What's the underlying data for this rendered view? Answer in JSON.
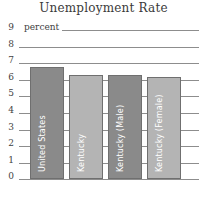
{
  "chart_data": {
    "type": "bar",
    "title": "Unemployment Rate",
    "xlabel": "",
    "ylabel": "percent",
    "unit_label": "percent",
    "ylim": [
      0,
      9
    ],
    "grid": true,
    "legend": "none",
    "categories": [
      "United States",
      "Kentucky",
      "Kentucky (Male)",
      "Kentucky (Female)"
    ],
    "values": [
      6.8,
      6.3,
      6.3,
      6.2
    ],
    "bar_colors": [
      "#8a8a8a",
      "#b4b4b4",
      "#8a8a8a",
      "#b4b4b4"
    ],
    "yticks": [
      9,
      8,
      7,
      6,
      5,
      4,
      3,
      2,
      1,
      0
    ],
    "ytick_labels": [
      "9",
      "8",
      "7",
      "6",
      "5",
      "4",
      "3",
      "2",
      "1",
      "0"
    ]
  },
  "colors": {
    "gridline": "#8d8d8d",
    "bar_dark": "#8a8a8a",
    "bar_light": "#b4b4b4",
    "bar_border": "#6f6f6f",
    "text": "#3f3f3f",
    "bar_label_text": "#ffffff",
    "background": "#ffffff"
  }
}
